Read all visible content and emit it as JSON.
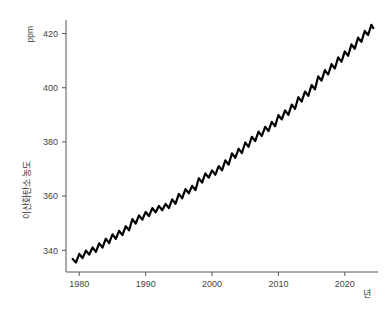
{
  "chart_data": {
    "type": "line",
    "title": "",
    "subtitle": "",
    "xlabel": "년",
    "ylabel": "이산화탄소 농도",
    "yunit": "ppm",
    "xlim": [
      1978.0,
      2025.0
    ],
    "ylim": [
      332.0,
      425.0
    ],
    "xticks": [
      1980,
      1990,
      2000,
      2010,
      2020
    ],
    "xtick_labels": [
      "1980",
      "1990",
      "2000",
      "2010",
      "2020"
    ],
    "yticks": [
      340,
      360,
      380,
      400,
      420
    ],
    "ytick_labels": [
      "340",
      "360",
      "380",
      "400",
      "420"
    ],
    "grid": false,
    "legend": null,
    "legend_position": "none",
    "line_color": "#000000",
    "line_width": 2.2,
    "axis_color": "#555555",
    "background": "#ffffff",
    "series": [
      {
        "name": "이산화탄소 농도",
        "description": "월평균 대기 중 CO2 농도, 계절 진동 포함",
        "seasonal_amplitude_ppm": 3.0,
        "x": [
          1979.0,
          1979.5,
          1980.0,
          1980.5,
          1981.0,
          1981.5,
          1982.0,
          1982.5,
          1983.0,
          1983.5,
          1984.0,
          1984.5,
          1985.0,
          1985.5,
          1986.0,
          1986.5,
          1987.0,
          1987.5,
          1988.0,
          1988.5,
          1989.0,
          1989.5,
          1990.0,
          1990.5,
          1991.0,
          1991.5,
          1992.0,
          1992.5,
          1993.0,
          1993.5,
          1994.0,
          1994.5,
          1995.0,
          1995.5,
          1996.0,
          1996.5,
          1997.0,
          1997.5,
          1998.0,
          1998.5,
          1999.0,
          1999.5,
          2000.0,
          2000.5,
          2001.0,
          2001.5,
          2002.0,
          2002.5,
          2003.0,
          2003.5,
          2004.0,
          2004.5,
          2005.0,
          2005.5,
          2006.0,
          2006.5,
          2007.0,
          2007.5,
          2008.0,
          2008.5,
          2009.0,
          2009.5,
          2010.0,
          2010.5,
          2011.0,
          2011.5,
          2012.0,
          2012.5,
          2013.0,
          2013.5,
          2014.0,
          2014.5,
          2015.0,
          2015.5,
          2016.0,
          2016.5,
          2017.0,
          2017.5,
          2018.0,
          2018.5,
          2019.0,
          2019.5,
          2020.0,
          2020.5,
          2021.0,
          2021.5,
          2022.0,
          2022.5,
          2023.0,
          2023.5,
          2024.0,
          2024.3
        ],
        "y": [
          336.8,
          335.5,
          338.7,
          337.1,
          339.9,
          338.4,
          341.1,
          339.4,
          342.6,
          341.0,
          344.3,
          342.7,
          345.9,
          344.2,
          347.2,
          345.6,
          348.9,
          347.4,
          351.5,
          349.9,
          352.9,
          351.3,
          354.2,
          352.6,
          355.6,
          354.0,
          356.4,
          354.8,
          357.1,
          355.6,
          358.8,
          357.2,
          360.8,
          359.2,
          362.6,
          361.0,
          363.8,
          362.2,
          366.6,
          365.0,
          368.4,
          366.8,
          369.5,
          367.9,
          371.1,
          369.5,
          373.2,
          371.6,
          375.8,
          374.1,
          377.5,
          375.9,
          379.8,
          378.2,
          381.9,
          380.3,
          383.8,
          382.2,
          385.6,
          384.0,
          387.4,
          385.8,
          389.9,
          388.3,
          391.6,
          390.0,
          393.8,
          392.2,
          396.5,
          394.9,
          398.6,
          397.0,
          401.0,
          399.4,
          404.2,
          402.6,
          406.5,
          404.9,
          408.7,
          407.1,
          411.2,
          409.6,
          413.4,
          411.8,
          416.0,
          414.4,
          418.5,
          416.9,
          421.0,
          419.4,
          423.2,
          422.0
        ]
      }
    ]
  },
  "labels": {
    "y_unit": "ppm",
    "y_title": "이산화탄소 농도",
    "x_title": "년"
  }
}
